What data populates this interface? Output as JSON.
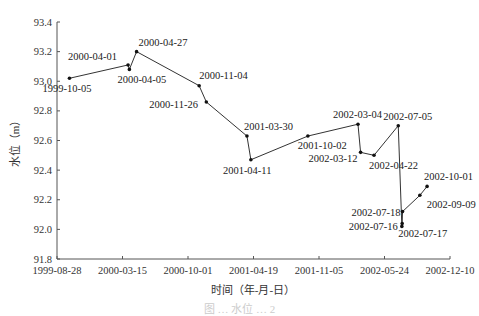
{
  "chart_data": {
    "type": "line",
    "title": "",
    "xlabel": "时间（年-月-日）",
    "ylabel": "水位（m）",
    "ylim": [
      91.8,
      93.4
    ],
    "yticks": [
      "93.4",
      "93.2",
      "93.0",
      "92.8",
      "92.6",
      "92.4",
      "92.2",
      "92.0",
      "91.8"
    ],
    "xticks": [
      "1999-08-28",
      "2000-03-15",
      "2000-10-01",
      "2001-04-19",
      "2001-11-05",
      "2002-05-24",
      "2002-12-10"
    ],
    "xlim": [
      "1999-08-28",
      "2002-12-10"
    ],
    "grid": false,
    "legend": null,
    "series": [
      {
        "name": "水位",
        "points": [
          {
            "x": "1999-10-05",
            "y": 93.02
          },
          {
            "x": "2000-04-01",
            "y": 93.11
          },
          {
            "x": "2000-04-05",
            "y": 93.08
          },
          {
            "x": "2000-04-27",
            "y": 93.2
          },
          {
            "x": "2000-11-04",
            "y": 92.97
          },
          {
            "x": "2000-11-26",
            "y": 92.86
          },
          {
            "x": "2001-03-30",
            "y": 92.63
          },
          {
            "x": "2001-04-11",
            "y": 92.47
          },
          {
            "x": "2001-10-02",
            "y": 92.63
          },
          {
            "x": "2002-03-04",
            "y": 92.71
          },
          {
            "x": "2002-03-12",
            "y": 92.52
          },
          {
            "x": "2002-04-22",
            "y": 92.5
          },
          {
            "x": "2002-07-05",
            "y": 92.7
          },
          {
            "x": "2002-07-16",
            "y": 92.02
          },
          {
            "x": "2002-07-17",
            "y": 92.04
          },
          {
            "x": "2002-07-18",
            "y": 92.12
          },
          {
            "x": "2002-09-09",
            "y": 92.23
          },
          {
            "x": "2002-10-01",
            "y": 92.29
          }
        ]
      }
    ],
    "annotations": [
      {
        "text": "1999-10-05",
        "dx": -27,
        "dy": 14
      },
      {
        "text": "2000-04-01",
        "dx": -60,
        "dy": -5
      },
      {
        "text": "2000-04-05",
        "dx": -12,
        "dy": 14
      },
      {
        "text": "2000-04-27",
        "dx": 2,
        "dy": -6
      },
      {
        "text": "2000-11-04",
        "dx": 0,
        "dy": -7
      },
      {
        "text": "2000-11-26",
        "dx": -57,
        "dy": 6
      },
      {
        "text": "2001-03-30",
        "dx": -3,
        "dy": -6
      },
      {
        "text": "2001-04-11",
        "dx": -28,
        "dy": 14
      },
      {
        "text": "2001-10-02",
        "dx": -10,
        "dy": 13
      },
      {
        "text": "2002-03-04",
        "dx": -25,
        "dy": -6
      },
      {
        "text": "2002-03-12",
        "dx": -52,
        "dy": 10
      },
      {
        "text": "2002-04-22",
        "dx": -5,
        "dy": 14
      },
      {
        "text": "2002-07-05",
        "dx": -15,
        "dy": -6
      },
      {
        "text": "2002-07-18",
        "dx": -51,
        "dy": 4
      },
      {
        "text": "2002-07-16",
        "dx": -53,
        "dy": 4
      },
      {
        "text": "2002-07-17",
        "dx": -4,
        "dy": 14
      },
      {
        "text": "2002-09-09",
        "dx": 7,
        "dy": 13
      },
      {
        "text": "2002-10-01",
        "dx": -3,
        "dy": -6
      }
    ]
  },
  "caption": "图 … 水位 … 2"
}
